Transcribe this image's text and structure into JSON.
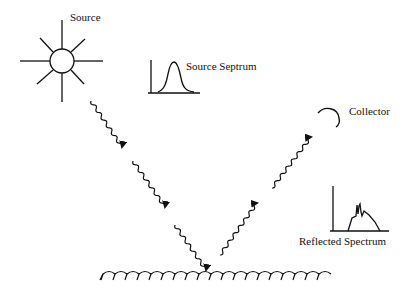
{
  "diagram": {
    "labels": {
      "source": "Source",
      "source_spectrum": "Source Septrum",
      "collector": "Collector",
      "reflected_spectrum": "Reflected Spectrum"
    },
    "elements": {
      "source_icon": "sun-icon",
      "collector_icon": "arc-collector-icon",
      "surface": "rough-surface",
      "incident_rays": 3,
      "reflected_rays": 2
    },
    "colors": {
      "stroke": "#111111",
      "background": "#ffffff"
    }
  }
}
